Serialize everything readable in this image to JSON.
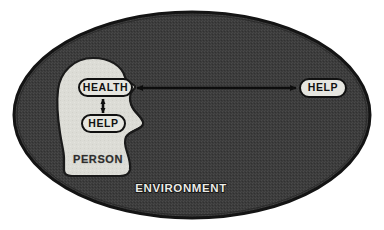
{
  "figure": {
    "type": "concept-diagram"
  },
  "environment": {
    "label": "ENVIRONMENT",
    "shape": "ellipse",
    "fill_color": "#3c3c3c",
    "border_color": "#141414",
    "label_color": "#e8e8e4",
    "label_outline_color": "#111111"
  },
  "person": {
    "label": "PERSON",
    "shape": "head-profile-silhouette",
    "fill_color": "#dcdcd6",
    "outline_color": "#1a1a1a",
    "label_color": "#2a2a2a"
  },
  "nodes": [
    {
      "id": "health-internal",
      "label": "HEALTH",
      "shape": "rounded-rect",
      "location": "inside-head",
      "fill_color": "#e6e6e0",
      "stroke_color": "#111111",
      "text_color": "#111111"
    },
    {
      "id": "help-internal",
      "label": "HELP",
      "shape": "rounded-rect",
      "location": "inside-head",
      "fill_color": "#e6e6e0",
      "stroke_color": "#111111",
      "text_color": "#111111"
    },
    {
      "id": "help-external",
      "label": "HELP",
      "shape": "rounded-rect",
      "location": "inside-environment-outside-head",
      "fill_color": "#e6e6e0",
      "stroke_color": "#111111",
      "text_color": "#111111"
    }
  ],
  "connectors": [
    {
      "id": "health-help-internal-link",
      "from": "health-internal",
      "to": "help-internal",
      "orientation": "vertical",
      "arrowheads": "both",
      "color": "#0d0d0d"
    },
    {
      "id": "health-help-external-link",
      "from": "health-internal",
      "to": "help-external",
      "orientation": "horizontal",
      "arrowheads": "both",
      "color": "#0d0d0d"
    }
  ],
  "background_color": "#ffffff"
}
